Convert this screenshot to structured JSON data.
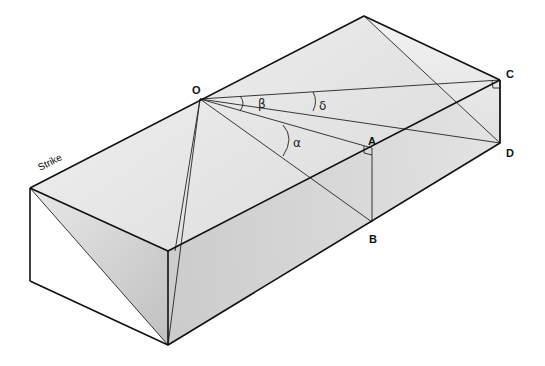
{
  "diagram": {
    "title": "",
    "labels": {
      "O": "O",
      "A": "A",
      "B": "B",
      "C": "C",
      "D": "D",
      "strike": "Strike"
    },
    "angles": {
      "alpha": "α",
      "beta": "β",
      "delta": "δ"
    },
    "colors": {
      "edge": "#111111",
      "face_light": "#ededed",
      "face_mid": "#d6d6d6",
      "face_dark": "#bdbdbd",
      "background": "#ffffff"
    }
  }
}
